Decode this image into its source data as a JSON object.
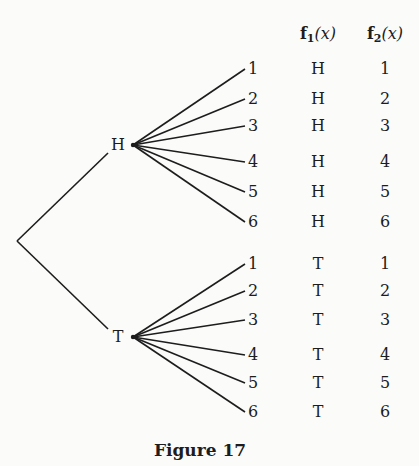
{
  "figure": {
    "caption": "Figure 17",
    "columns": {
      "f1": {
        "name": "f",
        "sub": "1",
        "arg": "(x)"
      },
      "f2": {
        "name": "f",
        "sub": "2",
        "arg": "(x)"
      }
    },
    "root": {
      "x": 17,
      "y": 241
    },
    "branches": [
      {
        "label": "H",
        "node": {
          "x": 133,
          "y": 145
        },
        "label_x": 118,
        "leaves": [
          {
            "label": "1",
            "y": 69,
            "f1": "H",
            "f2": "1"
          },
          {
            "label": "2",
            "y": 99,
            "f1": "H",
            "f2": "2"
          },
          {
            "label": "3",
            "y": 126,
            "f1": "H",
            "f2": "3"
          },
          {
            "label": "4",
            "y": 162,
            "f1": "H",
            "f2": "4"
          },
          {
            "label": "5",
            "y": 192,
            "f1": "H",
            "f2": "5"
          },
          {
            "label": "6",
            "y": 222,
            "f1": "H",
            "f2": "6"
          }
        ]
      },
      {
        "label": "T",
        "node": {
          "x": 133,
          "y": 337
        },
        "label_x": 118,
        "leaves": [
          {
            "label": "1",
            "y": 264,
            "f1": "T",
            "f2": "1"
          },
          {
            "label": "2",
            "y": 291,
            "f1": "T",
            "f2": "2"
          },
          {
            "label": "3",
            "y": 320,
            "f1": "T",
            "f2": "3"
          },
          {
            "label": "4",
            "y": 355,
            "f1": "T",
            "f2": "4"
          },
          {
            "label": "5",
            "y": 383,
            "f1": "T",
            "f2": "5"
          },
          {
            "label": "6",
            "y": 412,
            "f1": "T",
            "f2": "6"
          }
        ]
      }
    ],
    "layout": {
      "leaf_line_end_x": 245,
      "leaf_label_x": 253,
      "f1_x": 318,
      "f2_x": 385,
      "header_y": 36
    },
    "colors": {
      "ink": "#1d1d1d",
      "background": "#fbfbfa"
    }
  }
}
